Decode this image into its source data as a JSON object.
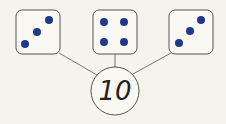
{
  "diagram": {
    "type": "number-bond",
    "parts": [
      {
        "label": "die-left",
        "value": 3
      },
      {
        "label": "die-middle",
        "value": 4
      },
      {
        "label": "die-right",
        "value": 3
      }
    ],
    "whole": "10",
    "colors": {
      "dot": "#1f3a8a",
      "stroke": "#555555",
      "background": "#f6f3ec",
      "face": "#faf8f2"
    }
  }
}
